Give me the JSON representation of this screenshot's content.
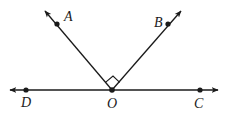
{
  "diagram": {
    "type": "geometry-angles",
    "colors": {
      "stroke": "#1a1a1a",
      "background": "#ffffff"
    },
    "line": {
      "name": "DC",
      "from": [
        10,
        90
      ],
      "to": [
        218,
        90
      ]
    },
    "rays": [
      {
        "name": "OA",
        "from": [
          112,
          90
        ],
        "to": [
          45,
          11
        ]
      },
      {
        "name": "OB",
        "from": [
          112,
          90
        ],
        "to": [
          181,
          11
        ]
      }
    ],
    "right_angle_marker": {
      "at": "O",
      "between": [
        "OA",
        "OB"
      ]
    },
    "points": [
      {
        "id": "A",
        "label": "A",
        "x": 57,
        "y": 24,
        "lx": 64,
        "ly": 21
      },
      {
        "id": "B",
        "label": "B",
        "x": 168,
        "y": 24,
        "lx": 154,
        "ly": 27
      },
      {
        "id": "D",
        "label": "D",
        "x": 26,
        "y": 90,
        "lx": 21,
        "ly": 107
      },
      {
        "id": "O",
        "label": "O",
        "x": 112,
        "y": 90,
        "lx": 107,
        "ly": 108
      },
      {
        "id": "C",
        "label": "C",
        "x": 200,
        "y": 90,
        "lx": 194,
        "ly": 108
      }
    ]
  }
}
